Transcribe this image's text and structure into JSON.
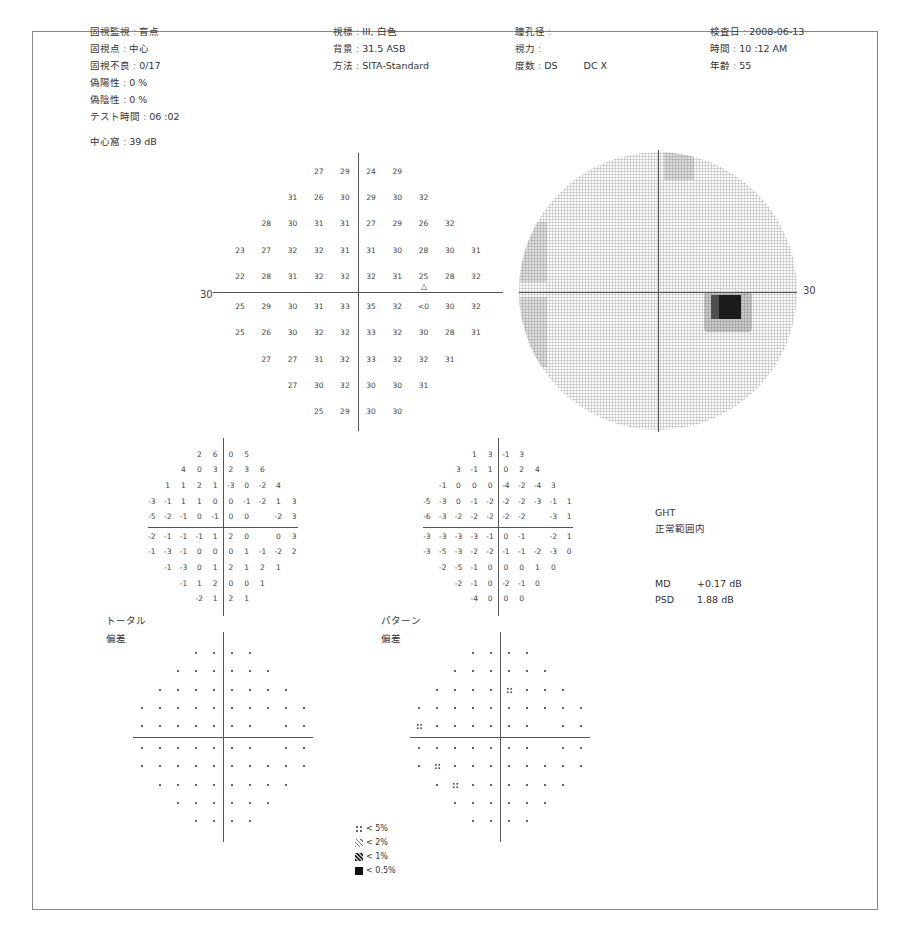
{
  "header": {
    "left": [
      {
        "label": "固視監視",
        "value": "盲点"
      },
      {
        "label": "固視点",
        "value": "中心"
      },
      {
        "label": "固視不良",
        "value": "0/17"
      },
      {
        "label": "偽陽性",
        "value": "0 %"
      },
      {
        "label": "偽陰性",
        "value": "0 %"
      },
      {
        "label": "テスト時間",
        "value": "06 :02"
      }
    ],
    "foveal": {
      "label": "中心窩",
      "value": "39 dB"
    },
    "middle": [
      {
        "label": "視標",
        "value": "III, 白色"
      },
      {
        "label": "背景",
        "value": "31.5 ASB"
      },
      {
        "label": "方法",
        "value": "SITA-Standard"
      }
    ],
    "right_mid": [
      {
        "label": "瞳孔径",
        "value": ""
      },
      {
        "label": "視力",
        "value": ""
      },
      {
        "label": "度数",
        "value": "DS",
        "value2": "DC X"
      }
    ],
    "right": [
      {
        "label": "検査日",
        "value": "2008-06-13"
      },
      {
        "label": "時間",
        "value": "10 :12 AM"
      },
      {
        "label": "年齢",
        "value": "55"
      }
    ]
  },
  "threshold_plot": {
    "axis_label": "30",
    "blind_spot_marker": "△",
    "rows": [
      [
        "",
        "",
        "",
        "27",
        "29",
        "24",
        "29",
        "",
        "",
        ""
      ],
      [
        "",
        "",
        "31",
        "26",
        "30",
        "29",
        "30",
        "32",
        "",
        ""
      ],
      [
        "",
        "28",
        "30",
        "31",
        "31",
        "27",
        "29",
        "26",
        "32",
        ""
      ],
      [
        "23",
        "27",
        "32",
        "32",
        "31",
        "31",
        "30",
        "28",
        "30",
        "31"
      ],
      [
        "22",
        "28",
        "31",
        "32",
        "32",
        "32",
        "31",
        "25",
        "28",
        "32"
      ],
      [
        "25",
        "29",
        "30",
        "31",
        "33",
        "35",
        "32",
        "<0",
        "30",
        "32"
      ],
      [
        "25",
        "26",
        "30",
        "32",
        "32",
        "33",
        "32",
        "30",
        "28",
        "31"
      ],
      [
        "",
        "27",
        "27",
        "31",
        "32",
        "33",
        "32",
        "32",
        "31",
        ""
      ],
      [
        "",
        "",
        "27",
        "30",
        "32",
        "30",
        "30",
        "31",
        "",
        ""
      ],
      [
        "",
        "",
        "",
        "25",
        "29",
        "30",
        "30",
        "",
        "",
        ""
      ]
    ]
  },
  "grayscale_plot": {
    "axis_label": "30"
  },
  "total_deviation": {
    "rows": [
      [
        "",
        "",
        "",
        "2",
        "6",
        "0",
        "5",
        "",
        "",
        ""
      ],
      [
        "",
        "",
        "4",
        "0",
        "3",
        "2",
        "3",
        "6",
        "",
        ""
      ],
      [
        "",
        "1",
        "1",
        "2",
        "1",
        "-3",
        "0",
        "-2",
        "4",
        ""
      ],
      [
        "-3",
        "-1",
        "1",
        "1",
        "0",
        "0",
        "-1",
        "-2",
        "1",
        "3"
      ],
      [
        "-5",
        "-2",
        "-1",
        "0",
        "-1",
        "0",
        "0",
        "",
        "-2",
        "3"
      ],
      [
        "-2",
        "-1",
        "-1",
        "-1",
        "1",
        "2",
        "0",
        "",
        "0",
        "3"
      ],
      [
        "-1",
        "-3",
        "-1",
        "0",
        "0",
        "0",
        "1",
        "-1",
        "-2",
        "2"
      ],
      [
        "",
        "-1",
        "-3",
        "0",
        "1",
        "2",
        "1",
        "2",
        "1",
        ""
      ],
      [
        "",
        "",
        "-1",
        "1",
        "2",
        "0",
        "0",
        "1",
        "",
        ""
      ],
      [
        "",
        "",
        "",
        "-2",
        "1",
        "2",
        "1",
        "",
        "",
        ""
      ]
    ],
    "caption_line1": "トータル",
    "caption_line2": "偏差"
  },
  "pattern_deviation": {
    "rows": [
      [
        "",
        "",
        "",
        "1",
        "3",
        "-1",
        "3",
        "",
        "",
        ""
      ],
      [
        "",
        "",
        "3",
        "-1",
        "1",
        "0",
        "2",
        "4",
        "",
        ""
      ],
      [
        "",
        "-1",
        "0",
        "0",
        "0",
        "-4",
        "-2",
        "-4",
        "3",
        ""
      ],
      [
        "-5",
        "-3",
        "0",
        "-1",
        "-2",
        "-2",
        "-2",
        "-3",
        "-1",
        "1"
      ],
      [
        "-6",
        "-3",
        "-2",
        "-2",
        "-2",
        "-2",
        "-2",
        "",
        "-3",
        "1"
      ],
      [
        "-3",
        "-3",
        "-3",
        "-3",
        "-1",
        "0",
        "-1",
        "",
        "-2",
        "1"
      ],
      [
        "-3",
        "-5",
        "-3",
        "-2",
        "-2",
        "-1",
        "-1",
        "-2",
        "-3",
        "0"
      ],
      [
        "",
        "-2",
        "-5",
        "-1",
        "0",
        "0",
        "0",
        "1",
        "0",
        ""
      ],
      [
        "",
        "",
        "-2",
        "-1",
        "0",
        "-2",
        "-1",
        "0",
        "",
        ""
      ],
      [
        "",
        "",
        "",
        "-4",
        "0",
        "0",
        "0",
        "",
        "",
        ""
      ]
    ],
    "caption_line1": "パターン",
    "caption_line2": "偏差"
  },
  "total_prob_flags": [],
  "pattern_prob_flags": [
    [
      2,
      5
    ],
    [
      4,
      0
    ],
    [
      6,
      1
    ],
    [
      7,
      2
    ]
  ],
  "ght": {
    "label": "GHT",
    "value": "正常範囲内"
  },
  "indices": [
    {
      "label": "MD",
      "value": "+0.17 dB"
    },
    {
      "label": "PSD",
      "value": "1.88 dB"
    }
  ],
  "legend": [
    {
      "symbol": "dots",
      "label": "< 5%"
    },
    {
      "symbol": "hatch-light",
      "label": "< 2%"
    },
    {
      "symbol": "hatch-dark",
      "label": "< 1%"
    },
    {
      "symbol": "solid",
      "label": "< 0.5%"
    }
  ]
}
